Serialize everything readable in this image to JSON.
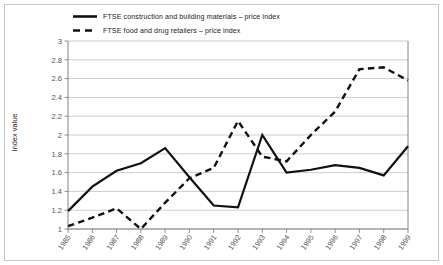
{
  "chart_data": {
    "type": "line",
    "title": "",
    "subtitle": "",
    "xlabel": "",
    "ylabel": "Index value",
    "x": [
      "1985",
      "1986",
      "1987",
      "1988",
      "1989",
      "1990",
      "1991",
      "1992",
      "1993",
      "1994",
      "1995",
      "1996",
      "1997",
      "1998",
      "1999"
    ],
    "categories": [
      "1985",
      "1986",
      "1987",
      "1988",
      "1989",
      "1990",
      "1991",
      "1992",
      "1993",
      "1994",
      "1995",
      "1996",
      "1997",
      "1998",
      "1999"
    ],
    "ylim": [
      1,
      3
    ],
    "yticks": [
      "1",
      "1.2",
      "1.4",
      "1.6",
      "1.8",
      "2",
      "2.2",
      "2.4",
      "2.6",
      "2.8",
      "3"
    ],
    "ytick_values": [
      1,
      1.2,
      1.4,
      1.6,
      1.8,
      2,
      2.2,
      2.4,
      2.6,
      2.8,
      3
    ],
    "grid": true,
    "grid_axis": "y",
    "legend_position": "top-left",
    "series": [
      {
        "name": "FTSE construction and building materials – price index",
        "style": "solid",
        "color": "#111111",
        "values": [
          1.19,
          1.45,
          1.62,
          1.7,
          1.86,
          1.55,
          1.25,
          1.23,
          2.0,
          1.6,
          1.63,
          1.68,
          1.65,
          1.57,
          1.88
        ]
      },
      {
        "name": "FTSE food and drug retailers – price index",
        "style": "dashed",
        "color": "#111111",
        "values": [
          1.03,
          1.12,
          1.22,
          1.0,
          1.28,
          1.54,
          1.65,
          2.15,
          1.77,
          1.72,
          2.0,
          2.25,
          2.7,
          2.72,
          2.58
        ]
      }
    ]
  },
  "legend": {
    "items": [
      {
        "label": "FTSE construction and building materials – price index",
        "style": "solid"
      },
      {
        "label": "FTSE food and drug retailers – price index",
        "style": "dashed"
      }
    ]
  },
  "axes": {
    "y_axis_title": "Index value"
  },
  "colors": {
    "frame": "#c8c8c8",
    "grid": "#b7b7b7",
    "axis": "#777777",
    "series": "#111111",
    "background": "#ffffff"
  }
}
